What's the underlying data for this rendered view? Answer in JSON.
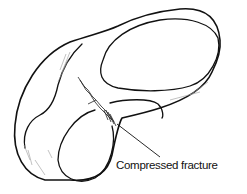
{
  "figure": {
    "annotation": {
      "label": "Compressed fracture"
    }
  }
}
